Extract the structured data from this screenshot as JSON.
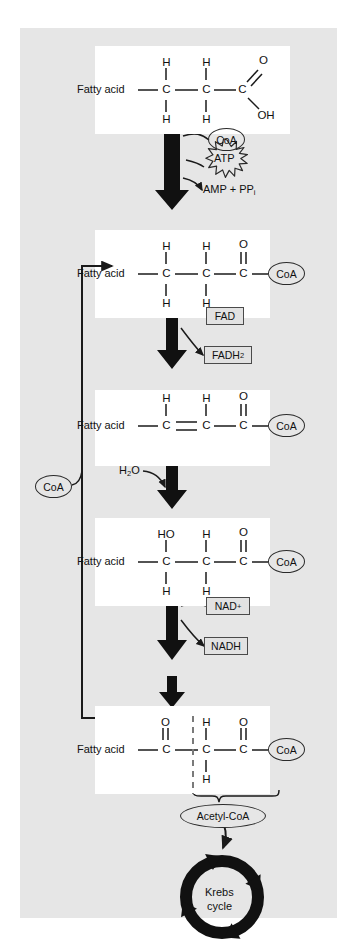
{
  "figure": {
    "background_color": "#e6e6e6",
    "card_color": "#ffffff"
  },
  "labels": {
    "fatty_acid": "Fatty acid",
    "coa": "CoA",
    "atp": "ATP",
    "amp_pp": "AMP + PP",
    "amp_pp_sub": "i",
    "fad": "FAD",
    "fadh2": "FADH",
    "fadh2_sub": "2",
    "water": "H",
    "water_sub": "2",
    "water_tail": "O",
    "nad_plus": "NAD",
    "nad_plus_sup": "+",
    "nadh": "NADH",
    "acetyl_coa": "Acetyl-CoA",
    "krebs_line1": "Krebs",
    "krebs_line2": "cycle",
    "atom_c": "C",
    "atom_h": "H",
    "atom_o": "O",
    "atom_oh": "OH",
    "atom_ho": "HO"
  },
  "molecules": [
    {
      "id": "fatty-acid-free",
      "name": "Fatty acid (free carboxylic acid)",
      "left_label": "Fatty acid",
      "top_atoms": [
        "H",
        "H",
        "O"
      ],
      "chain": [
        "C",
        "C",
        "C"
      ],
      "bottom_atoms": [
        "H",
        "H",
        ""
      ],
      "terminal": "OH",
      "terminal_type": "text"
    },
    {
      "id": "acyl-coa",
      "name": "Fatty acyl-CoA",
      "left_label": "Fatty acid",
      "top_atoms": [
        "H",
        "H",
        "O"
      ],
      "chain": [
        "C",
        "C",
        "C"
      ],
      "bottom_atoms": [
        "H",
        "H",
        ""
      ],
      "terminal": "CoA",
      "terminal_type": "ellipse"
    },
    {
      "id": "trans-enoyl-coa",
      "name": "trans-Enoyl-CoA",
      "left_label": "Fatty acid",
      "top_atoms": [
        "H",
        "H",
        "O"
      ],
      "chain": [
        "C",
        "C",
        "C"
      ],
      "bottom_atoms": [
        "",
        "",
        ""
      ],
      "terminal": "CoA",
      "terminal_type": "ellipse",
      "double_bond_between": [
        0,
        1
      ]
    },
    {
      "id": "hydroxyacyl-coa",
      "name": "3-Hydroxyacyl-CoA",
      "left_label": "Fatty acid",
      "top_atoms": [
        "HO",
        "H",
        "O"
      ],
      "chain": [
        "C",
        "C",
        "C"
      ],
      "bottom_atoms": [
        "H",
        "H",
        ""
      ],
      "terminal": "CoA",
      "terminal_type": "ellipse"
    },
    {
      "id": "ketoacyl-coa",
      "name": "3-Ketoacyl-CoA",
      "left_label": "Fatty acid",
      "top_atoms": [
        "O",
        "H",
        "O"
      ],
      "chain": [
        "C",
        "C",
        "C"
      ],
      "bottom_atoms": [
        "",
        "H",
        ""
      ],
      "terminal": "CoA",
      "terminal_type": "ellipse",
      "cleavage_dashed": true
    }
  ],
  "steps": [
    {
      "id": "activation",
      "inputs": [
        "CoA",
        "ATP"
      ],
      "outputs": [
        "AMP + PPi"
      ],
      "atp_starburst": true
    },
    {
      "id": "dehydrogenation",
      "inputs": [
        "FAD"
      ],
      "outputs": [
        "FADH2"
      ]
    },
    {
      "id": "hydration",
      "inputs": [
        "H2O"
      ],
      "outputs": []
    },
    {
      "id": "oxidation",
      "inputs": [
        "NAD+"
      ],
      "outputs": [
        "NADH"
      ]
    },
    {
      "id": "thiolysis",
      "inputs": [
        "CoA"
      ],
      "outputs": [
        "Acetyl-CoA"
      ]
    }
  ],
  "krebs": {
    "label_line1": "Krebs",
    "label_line2": "cycle",
    "arrow_count": 4
  },
  "colors": {
    "ink": "#1a1a1a",
    "panel": "#e6e6e6",
    "card": "#ffffff",
    "box_fill": "#e2e2e2",
    "box_border": "#4a4a4a"
  }
}
